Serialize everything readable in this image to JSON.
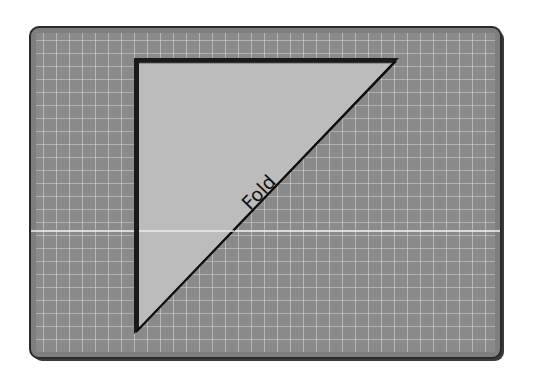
{
  "diagram": {
    "title": "",
    "label": "Fold",
    "mat": {
      "x": 30,
      "y": 27,
      "width": 471,
      "height": 331,
      "fill": "#8a8a8a",
      "border": "#2a2a2a",
      "grid_color": "#d8d8d8",
      "grid_spacing": 13
    },
    "triangle": {
      "points": [
        [
          136,
          61
        ],
        [
          396,
          61
        ],
        [
          136,
          331
        ]
      ],
      "fill": "#bdbdbd",
      "stroke": "#111111"
    },
    "crease_line": {
      "y": 231,
      "color": "#f2f2f2"
    }
  }
}
